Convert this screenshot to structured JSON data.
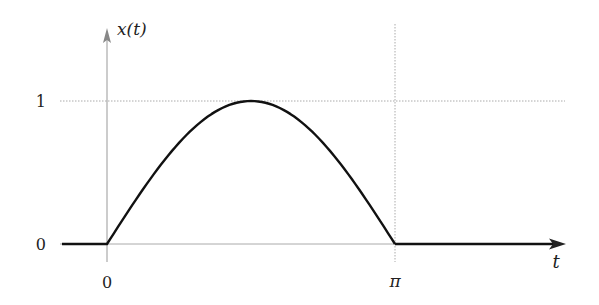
{
  "chart_data": {
    "type": "line",
    "title": "",
    "xlabel": "t",
    "ylabel": "x(t)",
    "x_ticks": [
      {
        "value": 0,
        "label": "0"
      },
      {
        "value": 3.14159,
        "label": "π"
      }
    ],
    "y_ticks": [
      {
        "value": 0,
        "label": "0"
      },
      {
        "value": 1,
        "label": "1"
      }
    ],
    "grid": "dotted guide lines at y=1 and x=π",
    "series": [
      {
        "name": "x(t)",
        "description": "x(t) = sin(t) for 0 ≤ t ≤ π, 0 otherwise",
        "x": [
          -0.53,
          0,
          0.3927,
          0.7854,
          1.1781,
          1.5708,
          1.9635,
          2.3562,
          2.7489,
          3.1416,
          4.83
        ],
        "y": [
          0,
          0,
          0.383,
          0.707,
          0.924,
          1.0,
          0.924,
          0.707,
          0.383,
          0,
          0
        ]
      }
    ],
    "xlim": [
      -0.53,
      4.9
    ],
    "ylim": [
      0,
      1.3
    ]
  },
  "labels": {
    "y_axis": "x(t)",
    "x_axis": "t",
    "y_tick_0": "0",
    "y_tick_1": "1",
    "x_tick_0": "0",
    "x_tick_pi": "π"
  },
  "colors": {
    "curve": "#111111",
    "axis": "#888888",
    "guide": "#aaaaaa"
  }
}
